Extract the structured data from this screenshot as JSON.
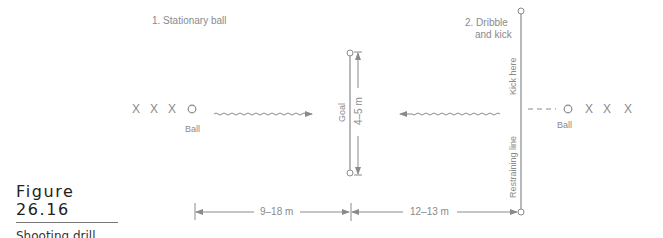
{
  "diagram": {
    "drill1_label": "1. Stationary ball",
    "drill2_label_line1": "2. Dribble",
    "drill2_label_line2": "and kick",
    "left_players": [
      "X",
      "X",
      "X"
    ],
    "right_players": [
      "X",
      "X",
      "X"
    ],
    "left_ball_label": "Ball",
    "right_ball_label": "Ball",
    "goal_label": "Goal",
    "goal_width_label": "4–5 m",
    "kick_here_label": "Kick here",
    "restraining_line_label": "Restraining line",
    "dist_left_label": "9–18 m",
    "dist_right_label": "12–13 m",
    "line_color": "#8a8a8a"
  },
  "caption": {
    "title": "Figure 26.16",
    "subtitle": "Shooting drill."
  }
}
